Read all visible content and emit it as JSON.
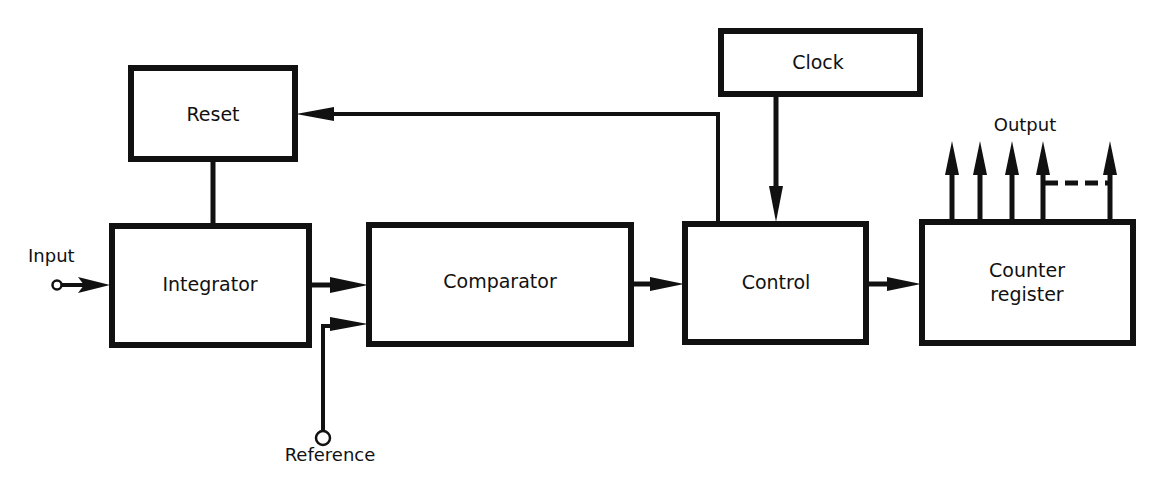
{
  "diagram": {
    "title": "",
    "colors": {
      "stroke": "#111111",
      "background": "#ffffff"
    },
    "blocks": {
      "reset": {
        "label": "Reset"
      },
      "integrator": {
        "label": "Integrator"
      },
      "comparator": {
        "label": "Comparator"
      },
      "control": {
        "label": "Control"
      },
      "clock": {
        "label": "Clock"
      },
      "counter": {
        "label_line1": "Counter",
        "label_line2": "register"
      }
    },
    "terminals": {
      "input": {
        "label": "Input"
      },
      "reference": {
        "label": "Reference"
      },
      "output": {
        "label": "Output"
      }
    },
    "connections": [
      {
        "from": "Input",
        "to": "Integrator"
      },
      {
        "from": "Integrator",
        "to": "Comparator"
      },
      {
        "from": "Reference",
        "to": "Comparator"
      },
      {
        "from": "Comparator",
        "to": "Control"
      },
      {
        "from": "Clock",
        "to": "Control"
      },
      {
        "from": "Control",
        "to": "Reset"
      },
      {
        "from": "Reset",
        "to": "Integrator"
      },
      {
        "from": "Control",
        "to": "Counter register"
      },
      {
        "from": "Counter register",
        "to": "Output"
      }
    ]
  }
}
